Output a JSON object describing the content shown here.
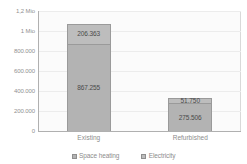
{
  "chart_data": {
    "type": "bar",
    "subtype": "stacked-column",
    "title": "",
    "xlabel": "",
    "ylabel": "",
    "categories": [
      "Existing",
      "Refurbished"
    ],
    "series": [
      {
        "name": "Space heating",
        "color": "#b3b3b3",
        "values": [
          867255,
          275506
        ],
        "labels": [
          "867.255",
          "275.506"
        ]
      },
      {
        "name": "Electricity",
        "color": "#bdbdbd",
        "values": [
          206363,
          51750
        ],
        "labels": [
          "206.363",
          "51.750"
        ]
      }
    ],
    "totals": [
      1073618,
      327256
    ],
    "ylim": [
      0,
      1200000
    ],
    "yticks": [
      0,
      200000,
      400000,
      600000,
      800000,
      1000000,
      1200000
    ],
    "ytick_labels": [
      "0",
      "200.000",
      "400.000",
      "600.000",
      "800.000",
      "1 Mio",
      "1,2 Mio"
    ],
    "grid": true,
    "legend_position": "bottom",
    "plot_background": "#fbfbfb",
    "gridline_color": "#ececec",
    "axis_color": "#b0b0b0",
    "text_color": "#8c8c8c"
  }
}
